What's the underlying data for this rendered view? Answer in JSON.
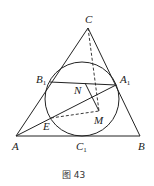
{
  "figure": {
    "caption": "图 43",
    "points": {
      "A": {
        "name": "A",
        "sub": ""
      },
      "B": {
        "name": "B",
        "sub": ""
      },
      "C": {
        "name": "C",
        "sub": ""
      },
      "A1": {
        "name": "A",
        "sub": "1"
      },
      "B1": {
        "name": "B",
        "sub": "1"
      },
      "C1": {
        "name": "C",
        "sub": "1"
      },
      "N": {
        "name": "N",
        "sub": ""
      },
      "M": {
        "name": "M",
        "sub": ""
      },
      "E": {
        "name": "E",
        "sub": ""
      }
    },
    "segments_solid": [
      "AB",
      "BC",
      "CA",
      "B1A1",
      "AA1",
      "NM"
    ],
    "segments_dashed": [
      "CM",
      "EM"
    ],
    "circle": "incircle tangent at A1, B1, C1"
  }
}
